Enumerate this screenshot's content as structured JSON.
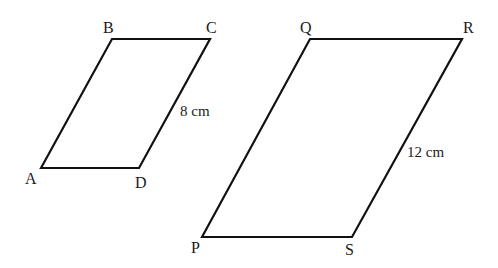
{
  "figure": {
    "small_parallelogram": {
      "vertices": {
        "A": "A",
        "B": "B",
        "C": "C",
        "D": "D"
      },
      "side_label": "8 cm"
    },
    "large_parallelogram": {
      "vertices": {
        "P": "P",
        "Q": "Q",
        "R": "R",
        "S": "S"
      },
      "side_label": "12 cm"
    },
    "stroke_color": "#111111"
  }
}
